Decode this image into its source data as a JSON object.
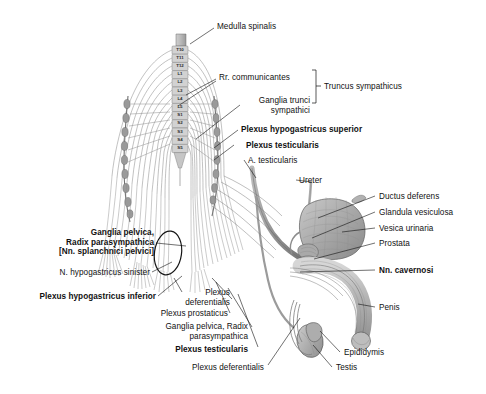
{
  "figure": {
    "title_visible": false,
    "background": "#ffffff",
    "ink": "#111111",
    "tissue_light": "#cfcfcf",
    "tissue_mid": "#a8a8a8",
    "tissue_dark": "#7d7d7d",
    "nerve_gray": "#8c8c8c"
  },
  "spinal_segments": {
    "label": "spinal-cord-segment-levels",
    "items": [
      "T10",
      "T11",
      "T12",
      "L1",
      "L2",
      "L3",
      "L4",
      "L5",
      "S1",
      "S2",
      "S3",
      "S4",
      "S5"
    ]
  },
  "labels": {
    "medulla_spinalis": "Medulla spinalis",
    "rr_communicantes": "Rr. communicantes",
    "ganglia_trunci_sympathici": "Ganglia trunci\nsympathici",
    "truncus_sympathicus": "Truncus sympathicus",
    "plexus_hypogastricus_superior": "Plexus hypogastricus superior",
    "plexus_testicularis_upper": "Plexus testicularis",
    "a_testicularis": "A. testicularis",
    "ureter": "Ureter",
    "ductus_deferens": "Ductus deferens",
    "glandula_vesiculosa": "Glandula vesiculosa",
    "vesica_urinaria": "Vesica urinaria",
    "prostata": "Prostata",
    "nn_cavernosi": "Nn. cavernosi",
    "penis": "Penis",
    "epididymis": "Epididymis",
    "testis": "Testis",
    "ganglia_pelvica_left": "Ganglia pelvica,\nRadix parasympathica\n[Nn. splanchnici pelvici]",
    "n_hypogastricus_sinister": "N. hypogastricus sinister",
    "plexus_hypogastricus_inferior": "Plexus hypogastricus inferior",
    "plexus_deferentialis_upper": "Plexus\ndeferentialis",
    "plexus_prostaticus": "Plexus prostaticus",
    "ganglia_pelvica_radix": "Ganglia pelvica, Radix\nparasympathica",
    "plexus_testicularis_lower": "Plexus testicularis",
    "plexus_deferentialis_lower": "Plexus deferentialis"
  },
  "bold_labels": [
    "Plexus hypogastricus superior",
    "Plexus testicularis",
    "Nn. cavernosi",
    "Ganglia pelvica,",
    "Radix parasympathica",
    "[Nn. splanchnici pelvici]",
    "Plexus hypogastricus inferior"
  ]
}
